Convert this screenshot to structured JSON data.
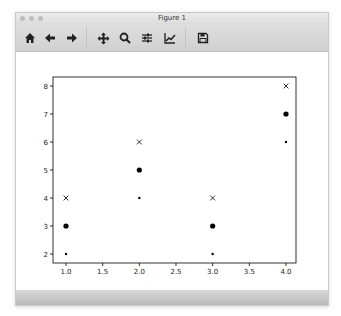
{
  "window": {
    "title": "Figure 1"
  },
  "toolbar": {
    "buttons": [
      {
        "name": "home",
        "icon": "home-icon",
        "glyph": "⌂"
      },
      {
        "name": "back",
        "icon": "arrow-left-icon",
        "glyph": "←"
      },
      {
        "name": "forward",
        "icon": "arrow-right-icon",
        "glyph": "→"
      },
      {
        "name": "pan",
        "icon": "move-icon",
        "glyph": "✥"
      },
      {
        "name": "zoom",
        "icon": "magnifier-icon",
        "glyph": "⚲"
      },
      {
        "name": "configure-subplots",
        "icon": "sliders-icon",
        "glyph": "☰"
      },
      {
        "name": "edit-axes",
        "icon": "line-chart-icon",
        "glyph": "⟋"
      },
      {
        "name": "save",
        "icon": "floppy-disk-icon",
        "glyph": "💾"
      }
    ]
  },
  "chart_data": {
    "type": "scatter",
    "title": "",
    "xlabel": "",
    "ylabel": "",
    "xlim": [
      0.9,
      4.1
    ],
    "ylim": [
      1.7,
      8.3
    ],
    "xticks": [
      "1.0",
      "1.5",
      "2.0",
      "2.5",
      "3.0",
      "3.5",
      "4.0"
    ],
    "yticks": [
      "2",
      "3",
      "4",
      "5",
      "6",
      "7",
      "8"
    ],
    "grid": false,
    "legend": null,
    "series": [
      {
        "name": "small dots",
        "marker": "point",
        "color": "#000000",
        "x": [
          1,
          2,
          3,
          4
        ],
        "y": [
          2,
          4,
          2,
          6
        ]
      },
      {
        "name": "large dots",
        "marker": "circle",
        "color": "#000000",
        "x": [
          1,
          2,
          3,
          4
        ],
        "y": [
          3,
          5,
          3,
          7
        ]
      },
      {
        "name": "crosses",
        "marker": "x",
        "color": "#000000",
        "x": [
          1,
          2,
          3,
          4
        ],
        "y": [
          4,
          6,
          4,
          8
        ]
      }
    ]
  }
}
